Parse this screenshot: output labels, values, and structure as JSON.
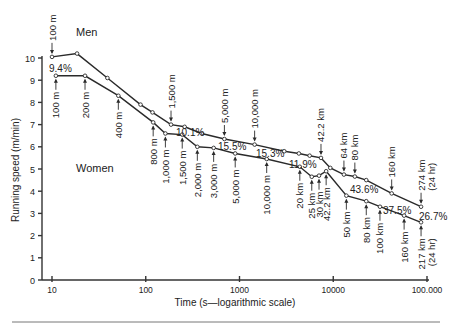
{
  "chart_data": {
    "type": "line",
    "title": "",
    "xlabel": "Time (s—logarithmic scale)",
    "ylabel": "Running speed (m/min)",
    "xscale": "log",
    "xlim": [
      8,
      110000
    ],
    "ylim": [
      0,
      10
    ],
    "x_ticks": [
      10,
      100,
      1000,
      10000,
      100000
    ],
    "x_tick_labels": [
      "10",
      "100",
      "1000",
      "10000",
      "100.000"
    ],
    "y_ticks": [
      0,
      1,
      2,
      3,
      4,
      5,
      6,
      7,
      8,
      9,
      10
    ],
    "grid": false,
    "series": [
      {
        "name": "Men",
        "label_pos": [
          76,
          36
        ],
        "points": [
          {
            "t": 10.0,
            "v": 10.05,
            "label": "100 m",
            "ann": "above"
          },
          {
            "t": 18.5,
            "v": 10.2
          },
          {
            "t": 39,
            "v": 9.1,
            "label": "",
            "ann": ""
          },
          {
            "t": 88,
            "v": 7.9
          },
          {
            "t": 118,
            "v": 7.55
          },
          {
            "t": 186,
            "v": 7.0,
            "label": "1,500 m",
            "ann": "above"
          },
          {
            "t": 260,
            "v": 6.9
          },
          {
            "t": 395,
            "v": 6.6
          },
          {
            "t": 690,
            "v": 6.35,
            "label": "5,000 m",
            "ann": "above"
          },
          {
            "t": 1450,
            "v": 6.1,
            "label": "10,000 m",
            "ann": "above"
          },
          {
            "t": 3000,
            "v": 5.8
          },
          {
            "t": 4300,
            "v": 5.7
          },
          {
            "t": 5600,
            "v": 5.6
          },
          {
            "t": 7400,
            "v": 5.5,
            "label": "42.2 km",
            "ann": "above"
          },
          {
            "t": 9300,
            "v": 5.05
          },
          {
            "t": 13000,
            "v": 4.75,
            "label": "64 km",
            "ann": "above"
          },
          {
            "t": 17000,
            "v": 4.66,
            "label": "80 km",
            "ann": "above"
          },
          {
            "t": 22500,
            "v": 4.5
          },
          {
            "t": 42000,
            "v": 3.9,
            "label": "160 km",
            "ann": "above"
          },
          {
            "t": 86400,
            "v": 3.3,
            "label": "274 km (24 hr)",
            "ann": "above"
          }
        ]
      },
      {
        "name": "Women",
        "label_pos": [
          76,
          172
        ],
        "points": [
          {
            "t": 11.0,
            "v": 9.2,
            "label": "100 m",
            "ann": "below"
          },
          {
            "t": 22.5,
            "v": 9.2,
            "label": "200 m",
            "ann": "below"
          },
          {
            "t": 51,
            "v": 8.3,
            "label": "400 m",
            "ann": "below"
          },
          {
            "t": 120,
            "v": 7.1,
            "label": "800 m",
            "ann": "below"
          },
          {
            "t": 162,
            "v": 6.6,
            "label": "1,000 m",
            "ann": "below"
          },
          {
            "t": 245,
            "v": 6.55,
            "label": "1,500 m",
            "ann": "below"
          },
          {
            "t": 355,
            "v": 6.0,
            "label": "2,000 m",
            "ann": "below"
          },
          {
            "t": 530,
            "v": 5.95,
            "label": "3,000 m",
            "ann": "below"
          },
          {
            "t": 900,
            "v": 5.7,
            "label": "5,000 m",
            "ann": "below"
          },
          {
            "t": 1950,
            "v": 5.45,
            "label": "10,000 m",
            "ann": "below"
          },
          {
            "t": 4400,
            "v": 5.1,
            "label": "20 km",
            "ann": "below"
          },
          {
            "t": 5900,
            "v": 4.65,
            "label": "25 km",
            "ann": "below"
          },
          {
            "t": 7050,
            "v": 4.7,
            "label": "30 km",
            "ann": "below"
          },
          {
            "t": 8400,
            "v": 4.9,
            "label": "42.2 km",
            "ann": "below"
          },
          {
            "t": 13800,
            "v": 3.8,
            "label": "50 km",
            "ann": "below"
          },
          {
            "t": 22500,
            "v": 3.55,
            "label": "80 km",
            "ann": "below"
          },
          {
            "t": 31500,
            "v": 3.3,
            "label": "100 km",
            "ann": "below"
          },
          {
            "t": 57000,
            "v": 2.9,
            "label": "160 km",
            "ann": "below"
          },
          {
            "t": 86400,
            "v": 2.6,
            "label": "217 km (24 hr)",
            "ann": "below"
          }
        ]
      }
    ],
    "annotations": [
      {
        "text": "9.4%",
        "x": 49,
        "y": 72
      },
      {
        "text": "10.1%",
        "x": 176,
        "y": 136
      },
      {
        "text": "15.5%",
        "x": 218,
        "y": 150
      },
      {
        "text": "15.3%",
        "x": 256,
        "y": 157
      },
      {
        "text": "11.9%",
        "x": 289,
        "y": 168
      },
      {
        "text": "43.6%",
        "x": 350,
        "y": 193
      },
      {
        "text": "37.5%",
        "x": 383,
        "y": 214
      },
      {
        "text": "26.7%",
        "x": 419,
        "y": 220
      }
    ]
  }
}
